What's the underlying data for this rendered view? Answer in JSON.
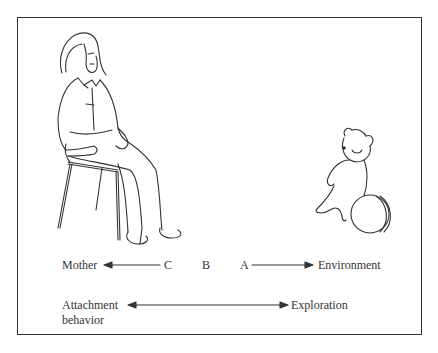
{
  "diagram": {
    "figures": {
      "mother": "seated-woman-illustration",
      "toy": "teddy-bear-and-ball-illustration"
    },
    "row1": {
      "left_label": "Mother",
      "points": [
        "C",
        "B",
        "A"
      ],
      "right_label": "Environment"
    },
    "row2": {
      "left_label_line1": "Attachment",
      "left_label_line2": "behavior",
      "right_label": "Exploration"
    },
    "colors": {
      "line": "#333333",
      "background": "#ffffff"
    }
  }
}
